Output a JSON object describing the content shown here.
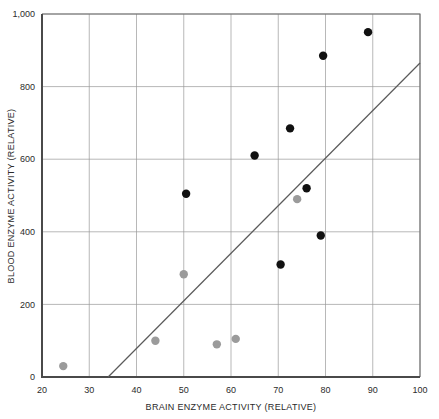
{
  "chart_data": {
    "type": "scatter",
    "title": "",
    "xlabel": "BRAIN ENZYME ACTIVITY (RELATIVE)",
    "ylabel": "BLOOD ENZYME ACTIVITY (RELATIVE)",
    "xlim": [
      20,
      100
    ],
    "ylim": [
      0,
      1000
    ],
    "xticks": [
      20,
      30,
      40,
      50,
      60,
      70,
      80,
      90,
      100
    ],
    "xtick_labels": [
      "20",
      "30",
      "40",
      "50",
      "60",
      "70",
      "80",
      "90",
      "100"
    ],
    "yticks": [
      0,
      200,
      400,
      600,
      800,
      1000
    ],
    "ytick_labels": [
      "0",
      "200",
      "400",
      "600",
      "800",
      "1,000"
    ],
    "grid": true,
    "legend": "none",
    "series": [
      {
        "name": "dark-points",
        "color": "#111111",
        "marker": "filled-circle",
        "points": [
          {
            "x": 50.5,
            "y": 505
          },
          {
            "x": 65.0,
            "y": 610
          },
          {
            "x": 70.5,
            "y": 310
          },
          {
            "x": 72.5,
            "y": 685
          },
          {
            "x": 76.0,
            "y": 520
          },
          {
            "x": 79.0,
            "y": 390
          },
          {
            "x": 79.5,
            "y": 885
          },
          {
            "x": 89.0,
            "y": 950
          }
        ]
      },
      {
        "name": "gray-points",
        "color": "#9b9b9b",
        "marker": "filled-circle",
        "points": [
          {
            "x": 24.5,
            "y": 30
          },
          {
            "x": 44.0,
            "y": 100
          },
          {
            "x": 50.0,
            "y": 283
          },
          {
            "x": 57.0,
            "y": 90
          },
          {
            "x": 61.0,
            "y": 105
          },
          {
            "x": 74.0,
            "y": 490
          }
        ]
      }
    ],
    "trendline": {
      "name": "regression-line",
      "color": "#5a5a5a",
      "x_start": 34,
      "y_start": 0,
      "x_end": 100,
      "y_end": 865
    }
  }
}
